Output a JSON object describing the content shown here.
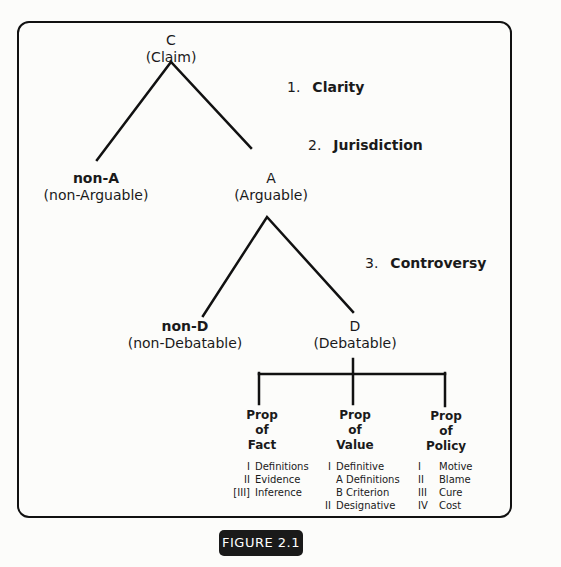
{
  "figure": {
    "label": "FIGURE 2.1"
  },
  "tree": {
    "root": {
      "symbol": "C",
      "description": "(Claim)"
    },
    "level1": {
      "left": {
        "symbol": "non-A",
        "description": "(non-Arguable)"
      },
      "right": {
        "symbol": "A",
        "description": "(Arguable)"
      }
    },
    "level2": {
      "left": {
        "symbol": "non-D",
        "description": "(non-Debatable)"
      },
      "right": {
        "symbol": "D",
        "description": "(Debatable)"
      }
    }
  },
  "criteria": [
    {
      "number": "1.",
      "label": "Clarity"
    },
    {
      "number": "2.",
      "label": "Jurisdiction"
    },
    {
      "number": "3.",
      "label": "Controversy"
    }
  ],
  "propositions": [
    {
      "title": [
        "Prop",
        "of",
        "Fact"
      ],
      "items": [
        {
          "num": "I",
          "text": "Definitions"
        },
        {
          "num": "II",
          "text": "Evidence"
        },
        {
          "num": "[III]",
          "text": "Inference"
        }
      ]
    },
    {
      "title": [
        "Prop",
        "of",
        "Value"
      ],
      "items": [
        {
          "num": "I",
          "text": "Definitive"
        },
        {
          "num": "",
          "text": "A Definitions"
        },
        {
          "num": "",
          "text": "B Criterion"
        },
        {
          "num": "II",
          "text": "Designative"
        }
      ]
    },
    {
      "title": [
        "Prop",
        "of",
        "Policy"
      ],
      "items": [
        {
          "num": "I",
          "text": "Motive"
        },
        {
          "num": "II",
          "text": "Blame"
        },
        {
          "num": "III",
          "text": "Cure"
        },
        {
          "num": "IV",
          "text": "Cost"
        }
      ]
    }
  ]
}
